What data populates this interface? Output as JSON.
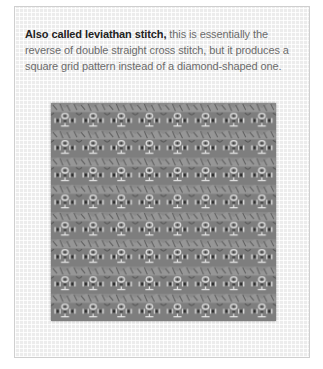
{
  "caption": {
    "lead": "Also called leviathan stitch,",
    "body": " this is essentially the reverse of double straight cross stitch, but it produces a square grid pattern instead of a diamond-shaped one."
  },
  "swatch": {
    "description": "Stitched sample of leviathan (Smyrna-style) stitch on canvas",
    "columns": 8,
    "rows": 8,
    "thread_color": "#7c7c7c",
    "canvas_color": "#ececec"
  }
}
